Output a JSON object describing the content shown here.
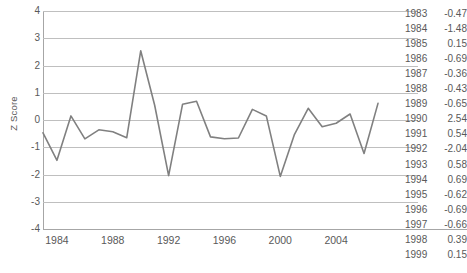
{
  "chart_data": {
    "type": "line",
    "title": "",
    "xlabel": "",
    "ylabel": "Z Score",
    "ylim": [
      -4,
      4
    ],
    "xlim": [
      1983,
      2007
    ],
    "grid": true,
    "legend": "none",
    "y_ticks": [
      4,
      3,
      2,
      1,
      0,
      -1,
      -2,
      -3,
      -4
    ],
    "x_ticks": [
      1984,
      1988,
      1992,
      1996,
      2000,
      2004
    ],
    "line_color": "#808080",
    "gridline_color": "#bfbfbf",
    "axis_color": "#a6a6a6",
    "text_color": "#595959",
    "x": [
      1983,
      1984,
      1985,
      1986,
      1987,
      1988,
      1989,
      1990,
      1991,
      1992,
      1993,
      1994,
      1995,
      1996,
      1997,
      1998,
      1999,
      2000,
      2001,
      2002,
      2003,
      2004,
      2005,
      2006,
      2007
    ],
    "values": [
      -0.47,
      -1.48,
      0.15,
      -0.69,
      -0.36,
      -0.43,
      -0.65,
      2.54,
      0.54,
      -2.04,
      0.58,
      0.69,
      -0.62,
      -0.69,
      -0.66,
      0.39,
      0.15,
      -2.07,
      -0.55,
      0.43,
      -0.25,
      -0.12,
      0.22,
      -1.23,
      0.61
    ]
  },
  "axis": {
    "y_title": "Z Score",
    "y_tick_labels": [
      "4",
      "3",
      "2",
      "1",
      "0",
      "-1",
      "-2",
      "-3",
      "-4"
    ],
    "x_tick_labels": [
      "1984",
      "1988",
      "1992",
      "1996",
      "2000",
      "2004"
    ]
  },
  "table": {
    "rows": [
      {
        "year": "1983",
        "value": "-0.47"
      },
      {
        "year": "1984",
        "value": "-1.48"
      },
      {
        "year": "1985",
        "value": "0.15"
      },
      {
        "year": "1986",
        "value": "-0.69"
      },
      {
        "year": "1987",
        "value": "-0.36"
      },
      {
        "year": "1988",
        "value": "-0.43"
      },
      {
        "year": "1989",
        "value": "-0.65"
      },
      {
        "year": "1990",
        "value": "2.54"
      },
      {
        "year": "1991",
        "value": "0.54"
      },
      {
        "year": "1992",
        "value": "-2.04"
      },
      {
        "year": "1993",
        "value": "0.58"
      },
      {
        "year": "1994",
        "value": "0.69"
      },
      {
        "year": "1995",
        "value": "-0.62"
      },
      {
        "year": "1996",
        "value": "-0.69"
      },
      {
        "year": "1997",
        "value": "-0.66"
      },
      {
        "year": "1998",
        "value": "0.39"
      },
      {
        "year": "1999",
        "value": "0.15"
      }
    ]
  }
}
